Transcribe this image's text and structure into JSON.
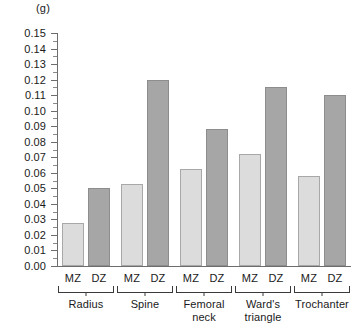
{
  "chart_data": {
    "type": "bar",
    "title": "",
    "subtitle": "",
    "xlabel": "",
    "ylabel": "(g)",
    "yunit": "(g)",
    "ylim": [
      0,
      0.15
    ],
    "ytick_step": 0.01,
    "minor_ticks": true,
    "grid": false,
    "legend": "none",
    "categories": [
      "Radius",
      "Spine",
      "Femoral neck",
      "Ward's triangle",
      "Trochanter"
    ],
    "subcategories": [
      "MZ",
      "DZ"
    ],
    "ytick_labels": [
      "0.15",
      "0.14",
      "0.13",
      "0.12",
      "0.11",
      "0.10",
      "0.09",
      "0.08",
      "0.07",
      "0.06",
      "0.05",
      "0.04",
      "0.03",
      "0.02",
      "0.01",
      "0.00"
    ],
    "series": [
      {
        "name": "MZ",
        "color": "#dcdcdc",
        "values": [
          0.028,
          0.053,
          0.0625,
          0.072,
          0.058
        ]
      },
      {
        "name": "DZ",
        "color": "#a6a6a6",
        "values": [
          0.05,
          0.12,
          0.088,
          0.1155,
          0.11
        ]
      }
    ],
    "bars": [
      {
        "group": "Radius",
        "sub": "MZ",
        "value": 0.028,
        "series": "MZ"
      },
      {
        "group": "Radius",
        "sub": "DZ",
        "value": 0.05,
        "series": "DZ"
      },
      {
        "group": "Spine",
        "sub": "MZ",
        "value": 0.053,
        "series": "MZ"
      },
      {
        "group": "Spine",
        "sub": "DZ",
        "value": 0.12,
        "series": "DZ"
      },
      {
        "group": "Femoral neck",
        "sub": "MZ",
        "value": 0.0625,
        "series": "MZ"
      },
      {
        "group": "Femoral neck",
        "sub": "DZ",
        "value": 0.088,
        "series": "DZ"
      },
      {
        "group": "Ward's triangle",
        "sub": "MZ",
        "value": 0.072,
        "series": "MZ"
      },
      {
        "group": "Ward's triangle",
        "sub": "DZ",
        "value": 0.1155,
        "series": "DZ"
      },
      {
        "group": "Trochanter",
        "sub": "MZ",
        "value": 0.058,
        "series": "MZ"
      },
      {
        "group": "Trochanter",
        "sub": "DZ",
        "value": 0.11,
        "series": "DZ"
      }
    ],
    "group_labels": [
      {
        "line1": "Radius",
        "line2": ""
      },
      {
        "line1": "Spine",
        "line2": ""
      },
      {
        "line1": "Femoral",
        "line2": "neck"
      },
      {
        "line1": "Ward's",
        "line2": "triangle"
      },
      {
        "line1": "Trochanter",
        "line2": ""
      }
    ]
  },
  "colors": {
    "mz_fill": "#dcdcdc",
    "dz_fill": "#a6a6a6",
    "axis": "#6d6d6d",
    "text": "#1a1a1a",
    "background": "#ffffff"
  }
}
